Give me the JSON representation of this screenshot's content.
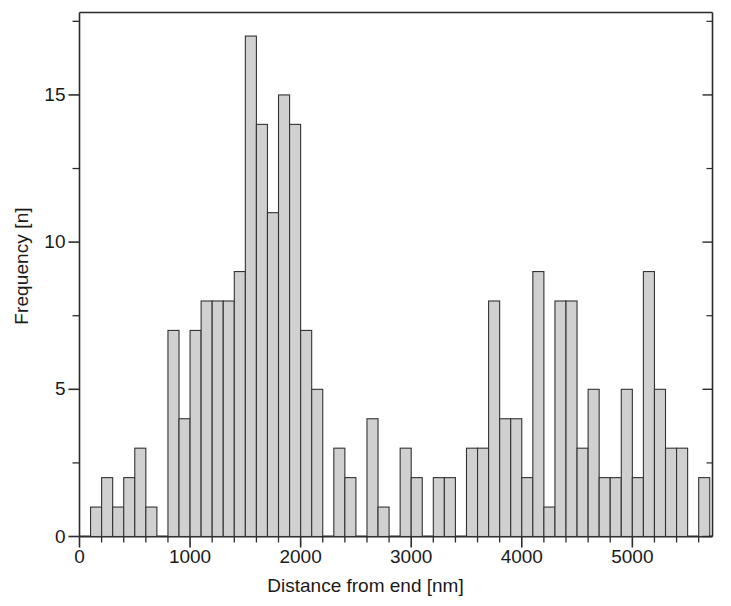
{
  "chart_data": {
    "type": "bar",
    "title": "",
    "subtitle": "",
    "xlabel": "Distance from end [nm]",
    "ylabel": "Frequency [n]",
    "bin_width": 100,
    "bin_unit": "nm",
    "xlim": [
      0,
      5725
    ],
    "ylim": [
      0,
      17.8
    ],
    "grid": false,
    "legend": null,
    "annotations": [],
    "x_ticks_major": [
      0,
      1000,
      2000,
      3000,
      4000,
      5000
    ],
    "x_tick_labels": [
      "0",
      "1000",
      "2000",
      "3000",
      "4000",
      "5000"
    ],
    "x_ticks_minor_step": 200,
    "y_ticks_major": [
      0,
      5,
      10,
      15
    ],
    "y_tick_labels": [
      "0",
      "5",
      "10",
      "15"
    ],
    "y_ticks_minor": [
      2.5,
      7.5,
      12.5,
      17.5
    ],
    "bar_fill_color": "#d0d0d0",
    "bar_edge_color": "#333333",
    "axis_color": "#2b2b2b",
    "bin_starts": [
      100,
      200,
      300,
      400,
      500,
      600,
      700,
      800,
      900,
      1000,
      1100,
      1200,
      1300,
      1400,
      1500,
      1600,
      1700,
      1800,
      1900,
      2000,
      2100,
      2200,
      2300,
      2400,
      2500,
      2600,
      2700,
      2800,
      2900,
      3000,
      3100,
      3200,
      3300,
      3400,
      3500,
      3600,
      3700,
      3800,
      3900,
      4000,
      4100,
      4200,
      4300,
      4400,
      4500,
      4600,
      4700,
      4800,
      4900,
      5000,
      5100,
      5200,
      5300,
      5400,
      5500,
      5600
    ],
    "categories": [
      "100",
      "200",
      "300",
      "400",
      "500",
      "600",
      "700",
      "800",
      "900",
      "1000",
      "1100",
      "1200",
      "1300",
      "1400",
      "1500",
      "1600",
      "1700",
      "1800",
      "1900",
      "2000",
      "2100",
      "2200",
      "2300",
      "2400",
      "2500",
      "2600",
      "2700",
      "2800",
      "2900",
      "3000",
      "3100",
      "3200",
      "3300",
      "3400",
      "3500",
      "3600",
      "3700",
      "3800",
      "3900",
      "4000",
      "4100",
      "4200",
      "4300",
      "4400",
      "4500",
      "4600",
      "4700",
      "4800",
      "4900",
      "5000",
      "5100",
      "5200",
      "5300",
      "5400",
      "5500",
      "5600"
    ],
    "values": [
      1,
      2,
      1,
      2,
      3,
      1,
      0,
      7,
      4,
      7,
      8,
      8,
      8,
      9,
      17,
      14,
      11,
      15,
      14,
      7,
      5,
      0,
      3,
      2,
      0,
      4,
      1,
      0,
      3,
      2,
      0,
      2,
      2,
      0,
      3,
      3,
      8,
      4,
      4,
      2,
      9,
      1,
      8,
      8,
      3,
      5,
      2,
      2,
      5,
      2,
      9,
      5,
      3,
      3,
      0,
      2
    ]
  }
}
